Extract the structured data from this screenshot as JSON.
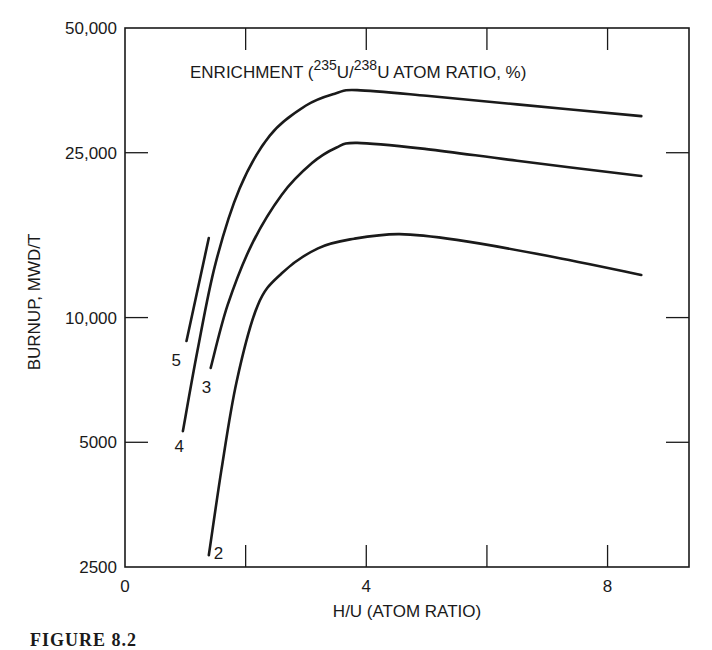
{
  "figure": {
    "caption": "FIGURE 8.2"
  },
  "chart_data": {
    "type": "line",
    "title": "ENRICHMENT (235U/238U ATOM RATIO, %)",
    "title_parts": {
      "prefix": "ENRICHMENT (",
      "sup1": "235",
      "mid": "U/",
      "sup2": "238",
      "suffix": "U ATOM RATIO, %)"
    },
    "xlabel": "H/U (ATOM RATIO)",
    "ylabel": "BURNUP, MWD/T",
    "xscale": "linear",
    "yscale": "log",
    "xlim": [
      0,
      9.35
    ],
    "ylim": [
      2500,
      50000
    ],
    "xticks": [
      0,
      2,
      4,
      6,
      8
    ],
    "xtick_labels": [
      "0",
      "",
      "4",
      "",
      "8"
    ],
    "yticks": [
      2500,
      5000,
      10000,
      25000,
      50000
    ],
    "ytick_labels": [
      "2500",
      "5000",
      "10,000",
      "25,000",
      "50,000"
    ],
    "grid": false,
    "legend": "curve labels inline (enrichment %)",
    "series": [
      {
        "name": "5",
        "label_pos": [
          0.85,
          7900
        ],
        "points": [
          [
            1.02,
            8780
          ],
          [
            1.39,
            15560
          ]
        ]
      },
      {
        "name": "4",
        "label_pos": [
          0.9,
          4900
        ],
        "points": [
          [
            0.96,
            5320
          ],
          [
            1.2,
            8300
          ],
          [
            1.5,
            13500
          ],
          [
            1.9,
            20500
          ],
          [
            2.4,
            27500
          ],
          [
            3.0,
            32500
          ],
          [
            3.5,
            34800
          ],
          [
            3.85,
            35400
          ],
          [
            5.0,
            34300
          ],
          [
            6.5,
            32700
          ],
          [
            8.56,
            30650
          ]
        ]
      },
      {
        "name": "3",
        "label_pos": [
          1.35,
          6800
        ],
        "points": [
          [
            1.42,
            7560
          ],
          [
            1.7,
            10700
          ],
          [
            2.1,
            15000
          ],
          [
            2.6,
            19800
          ],
          [
            3.1,
            23600
          ],
          [
            3.5,
            25700
          ],
          [
            3.85,
            26400
          ],
          [
            5.0,
            25500
          ],
          [
            6.5,
            23900
          ],
          [
            8.56,
            21960
          ]
        ]
      },
      {
        "name": "2",
        "label_pos": [
          1.55,
          2700
        ],
        "points": [
          [
            1.39,
            2670
          ],
          [
            1.6,
            4300
          ],
          [
            1.85,
            7000
          ],
          [
            2.2,
            10700
          ],
          [
            2.6,
            12800
          ],
          [
            3.2,
            14700
          ],
          [
            3.8,
            15500
          ],
          [
            4.55,
            15900
          ],
          [
            5.5,
            15400
          ],
          [
            7.0,
            14100
          ],
          [
            8.56,
            12670
          ]
        ]
      }
    ]
  }
}
